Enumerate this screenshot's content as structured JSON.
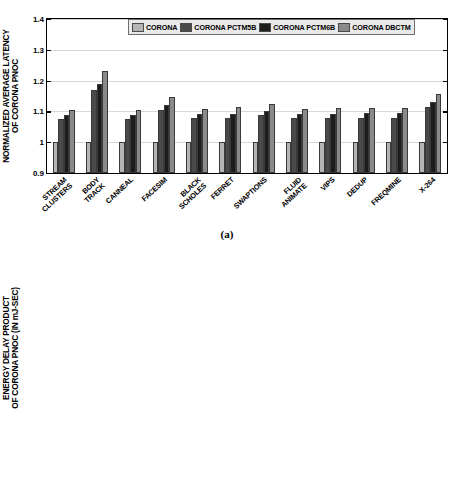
{
  "figure": {
    "caption_a": "(a)",
    "caption_b": "(b)"
  },
  "legend": {
    "items": [
      {
        "label": "CORONA",
        "color": "#b4b4b4"
      },
      {
        "label": "CORONA PCTM5B",
        "color": "#4a4a4a"
      },
      {
        "label": "CORONA PCTM6B",
        "color": "#1c1c1c"
      },
      {
        "label": "CORONA DBCTM",
        "color": "#8a8a8a"
      }
    ]
  },
  "chart_data": [
    {
      "type": "bar",
      "id": "panel-a",
      "title": "",
      "ylabel": "NORMALIZED AVERAGE LATENCY\nOF CORONA PNOC",
      "xlabel": "",
      "ylim": [
        0.9,
        1.4
      ],
      "yticks": [
        0.9,
        1.0,
        1.1,
        1.2,
        1.3,
        1.4
      ],
      "ytick_labels": [
        "0.9",
        "1",
        "1.1",
        "1.2",
        "1.3",
        "1.4"
      ],
      "grid": true,
      "legend_position": "top",
      "categories": [
        "STREAM\nCLUSTERS",
        "BODY\nTRACK",
        "CANNEAL",
        "FACESIM",
        "BLACK\nSCHOLES",
        "FERRET",
        "SWAPTIONS",
        "FLUID\nANIMATE",
        "VIPS",
        "DEDUP",
        "FREQMINE",
        "X-264"
      ],
      "series": [
        {
          "name": "CORONA",
          "color": "#b4b4b4",
          "values": [
            1.0,
            1.0,
            1.0,
            1.0,
            1.0,
            1.0,
            1.0,
            1.0,
            1.0,
            1.0,
            1.0,
            1.0
          ]
        },
        {
          "name": "CORONA PCTM5B",
          "color": "#4a4a4a",
          "values": [
            1.075,
            1.17,
            1.075,
            1.105,
            1.078,
            1.08,
            1.088,
            1.078,
            1.078,
            1.08,
            1.079,
            1.115
          ]
        },
        {
          "name": "CORONA PCTM6B",
          "color": "#1c1c1c",
          "values": [
            1.088,
            1.19,
            1.088,
            1.122,
            1.09,
            1.093,
            1.1,
            1.09,
            1.09,
            1.094,
            1.095,
            1.13
          ]
        },
        {
          "name": "CORONA DBCTM",
          "color": "#8a8a8a",
          "values": [
            1.105,
            1.23,
            1.105,
            1.148,
            1.108,
            1.113,
            1.123,
            1.108,
            1.11,
            1.112,
            1.11,
            1.155
          ]
        }
      ]
    },
    {
      "type": "bar",
      "id": "panel-b",
      "title": "",
      "ylabel": "ENERGY DELAY PRODUCT\nOF CORONA PNOC (IN mJ-SEC)",
      "xlabel": "",
      "ylim": [
        0.5,
        5.0
      ],
      "yticks": [
        0.5,
        1.0,
        1.5,
        2.0,
        2.5,
        3.0,
        3.5,
        4.0,
        4.5,
        5.0
      ],
      "ytick_labels": [
        "0.5",
        "1",
        "1.5",
        "2",
        "2.5",
        "3",
        "3.5",
        "4",
        "4.5",
        "5"
      ],
      "grid": true,
      "legend_position": "top",
      "has_error_bars": true,
      "categories": [
        "STREAM\nCLUSTERS",
        "BODY\nTRACK",
        "CANNEAL",
        "FACESIM",
        "BLACK\nSCHOLES",
        "FERRET",
        "SWAPTIONS",
        "FLUID\nANIMATE",
        "VIPS",
        "DEDUP",
        "FREQMINE",
        "X-264"
      ],
      "series": [
        {
          "name": "CORONA",
          "color": "#b4b4b4",
          "values": [
            2.23,
            1.05,
            2.25,
            1.67,
            2.28,
            2.23,
            2.07,
            2.3,
            2.33,
            2.28,
            2.29,
            1.67
          ],
          "errors": [
            0.12,
            0.07,
            0.1,
            0.07,
            0.1,
            0.09,
            0.08,
            0.08,
            0.09,
            0.09,
            0.09,
            0.07
          ]
        },
        {
          "name": "CORONA PCTM5B",
          "color": "#4a4a4a",
          "values": [
            2.92,
            1.46,
            2.92,
            2.21,
            2.95,
            2.91,
            2.72,
            2.99,
            3.05,
            2.94,
            2.94,
            2.2
          ],
          "errors": [
            0.13,
            0.08,
            0.13,
            0.1,
            0.15,
            0.13,
            0.11,
            0.19,
            0.18,
            0.13,
            0.14,
            0.1
          ]
        },
        {
          "name": "CORONA PCTM6B",
          "color": "#1c1c1c",
          "values": [
            3.5,
            1.7,
            3.5,
            2.62,
            3.54,
            3.47,
            3.22,
            3.56,
            3.62,
            3.51,
            3.54,
            2.63
          ],
          "errors": [
            0.17,
            0.09,
            0.16,
            0.1,
            0.16,
            0.16,
            0.14,
            0.18,
            0.18,
            0.16,
            0.17,
            0.11
          ]
        },
        {
          "name": "CORONA DBCTM",
          "color": "#8a8a8a",
          "values": [
            2.93,
            1.51,
            2.93,
            2.23,
            2.96,
            2.91,
            2.74,
            3.0,
            3.05,
            2.96,
            2.96,
            2.24
          ],
          "errors": [
            0.14,
            0.09,
            0.14,
            0.08,
            0.13,
            0.12,
            0.11,
            0.18,
            0.17,
            0.13,
            0.14,
            0.1
          ]
        }
      ]
    }
  ]
}
